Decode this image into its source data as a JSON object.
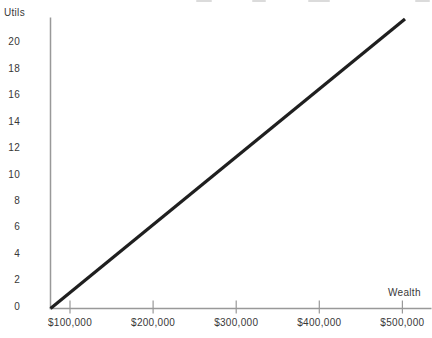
{
  "colors": {
    "background": "#ffffff",
    "axis": "#999999",
    "tick": "#999999",
    "text": "#383838",
    "line": "#1f1f1f"
  },
  "chart_data": {
    "type": "line",
    "title": "",
    "xlabel": "Wealth",
    "ylabel": "Utils",
    "x_ticks": [
      {
        "label": "$100,000",
        "value": 100000
      },
      {
        "label": "$200,000",
        "value": 200000
      },
      {
        "label": "$300,000",
        "value": 300000
      },
      {
        "label": "$400,000",
        "value": 400000
      },
      {
        "label": "$500,000",
        "value": 500000
      }
    ],
    "y_ticks": [
      0,
      2,
      4,
      6,
      8,
      10,
      12,
      14,
      16,
      18,
      20
    ],
    "ylim": [
      0,
      20
    ],
    "xlim": [
      0,
      500000
    ],
    "grid": false,
    "legend": "none",
    "series": [
      {
        "name": "utility-of-wealth",
        "color": "#1f1f1f",
        "shape": "straight-line-from-origin",
        "points": [
          [
            0,
            0
          ],
          [
            100000,
            4
          ],
          [
            200000,
            8
          ],
          [
            300000,
            12
          ],
          [
            400000,
            16
          ],
          [
            500000,
            20
          ]
        ]
      }
    ],
    "relationship": "utils = wealth / 25000 (linear utility of wealth)"
  }
}
